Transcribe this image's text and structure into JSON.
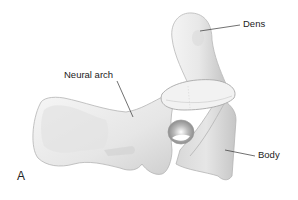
{
  "figure": {
    "panel_letter": "A",
    "labels": [
      {
        "id": "dens",
        "text": "Dens",
        "x": 243,
        "y": 19,
        "pointer": [
          [
            200,
            31
          ],
          [
            240,
            25
          ]
        ]
      },
      {
        "id": "neural-arch",
        "text": "Neural arch",
        "x": 64,
        "y": 70,
        "pointer": [
          [
            117,
            81
          ],
          [
            133,
            117
          ]
        ]
      },
      {
        "id": "body",
        "text": "Body",
        "x": 258,
        "y": 150,
        "pointer": [
          [
            225,
            150
          ],
          [
            255,
            156
          ]
        ]
      }
    ],
    "colors": {
      "background": "#ffffff",
      "bone_fill": "#ececec",
      "bone_shadow": "#c8c8c8",
      "bone_outline": "#b4b4b4",
      "text": "#222222",
      "leader_line": "#333333"
    }
  }
}
